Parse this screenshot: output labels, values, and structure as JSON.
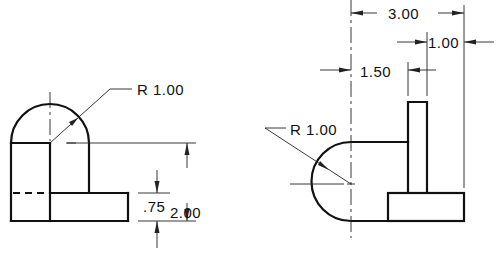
{
  "drawing": {
    "type": "orthographic-projection",
    "views": [
      {
        "name": "front-view",
        "labels": {
          "radius": "R 1.00",
          "height_total": "2.00",
          "base_thickness": ".75"
        }
      },
      {
        "name": "top-view",
        "labels": {
          "radius": "R 1.00",
          "overall_width": "3.00",
          "rib_offset": "1.00",
          "rib_position": "1.50"
        }
      }
    ],
    "colors": {
      "line": "#111111",
      "background": "#ffffff"
    }
  }
}
